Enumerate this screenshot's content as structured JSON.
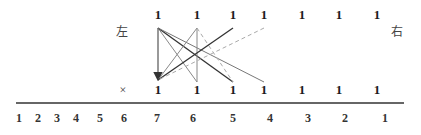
{
  "left_label": "左",
  "right_label": "右",
  "cross_label": "×",
  "top_row": [
    "1",
    "1",
    "1",
    "1",
    "1",
    "1",
    "1"
  ],
  "bottom_row": [
    "1",
    "1",
    "1",
    "1",
    "1",
    "1",
    "1"
  ],
  "axis_numbers": [
    "1",
    "2",
    "3",
    "4",
    "5",
    "6",
    "7",
    "6",
    "5",
    "4",
    "3",
    "2",
    "1"
  ],
  "colors": {
    "line_dark": "#333333",
    "line_mid": "#777777",
    "line_light": "#999999",
    "dashed": "#aaaaaa",
    "rule": "#333333"
  }
}
